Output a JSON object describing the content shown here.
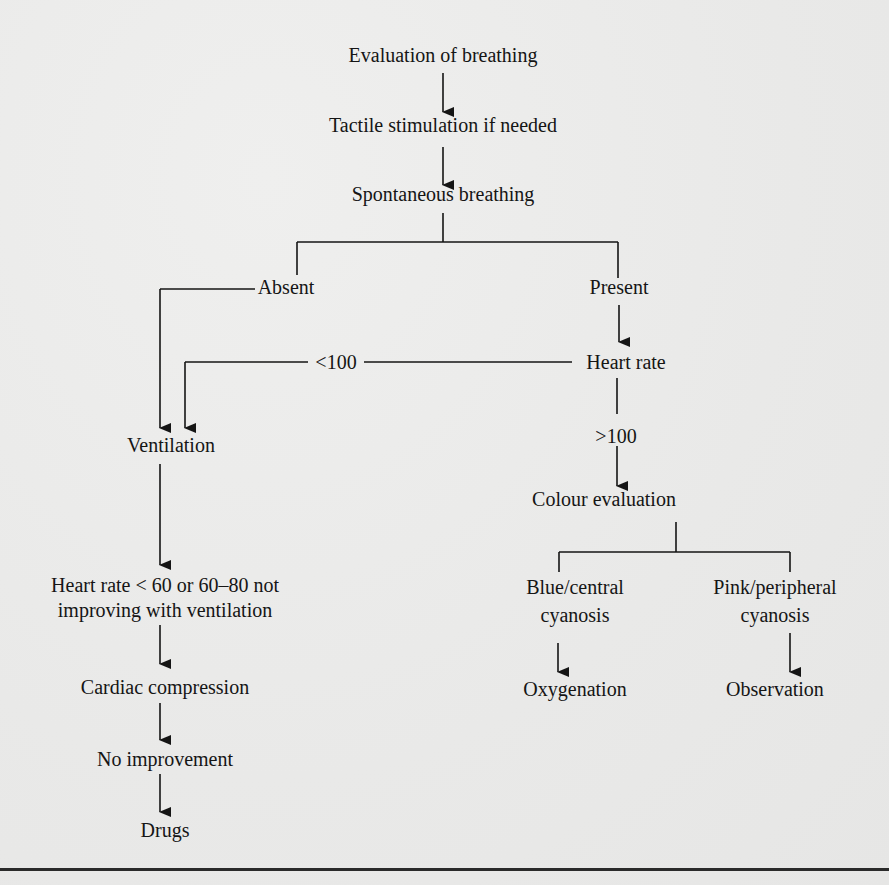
{
  "flowchart": {
    "nodes": {
      "evaluation": "Evaluation of breathing",
      "tactile": "Tactile stimulation if needed",
      "spontaneous": "Spontaneous breathing",
      "absent": "Absent",
      "present": "Present",
      "heart_rate": "Heart rate",
      "lt100": "<100",
      "gt100": ">100",
      "ventilation": "Ventilation",
      "colour_evaluation": "Colour evaluation",
      "hr_low_line1": "Heart rate < 60 or 60–80 not",
      "hr_low_line2": "improving with ventilation",
      "blue_line1": "Blue/central",
      "blue_line2": "cyanosis",
      "pink_line1": "Pink/peripheral",
      "pink_line2": "cyanosis",
      "cardiac": "Cardiac compression",
      "oxygenation": "Oxygenation",
      "observation": "Observation",
      "no_improvement": "No improvement",
      "drugs": "Drugs"
    },
    "edges": [
      [
        "Evaluation of breathing",
        "Tactile stimulation if needed"
      ],
      [
        "Tactile stimulation if needed",
        "Spontaneous breathing"
      ],
      [
        "Spontaneous breathing",
        "Absent"
      ],
      [
        "Spontaneous breathing",
        "Present"
      ],
      [
        "Absent",
        "Ventilation"
      ],
      [
        "Present",
        "Heart rate"
      ],
      [
        "Heart rate",
        "<100"
      ],
      [
        "<100",
        "Ventilation"
      ],
      [
        "Heart rate",
        ">100"
      ],
      [
        ">100",
        "Colour evaluation"
      ],
      [
        "Ventilation",
        "Heart rate < 60 or 60–80 not improving with ventilation"
      ],
      [
        "Colour evaluation",
        "Blue/central cyanosis"
      ],
      [
        "Colour evaluation",
        "Pink/peripheral cyanosis"
      ],
      [
        "Blue/central cyanosis",
        "Oxygenation"
      ],
      [
        "Pink/peripheral cyanosis",
        "Observation"
      ],
      [
        "Heart rate < 60 or 60–80 not improving with ventilation",
        "Cardiac compression"
      ],
      [
        "Cardiac compression",
        "No improvement"
      ],
      [
        "No improvement",
        "Drugs"
      ]
    ]
  },
  "colors": {
    "ink": "#151515",
    "paper": "#ebebea",
    "show_through": "#cfcfcd"
  }
}
